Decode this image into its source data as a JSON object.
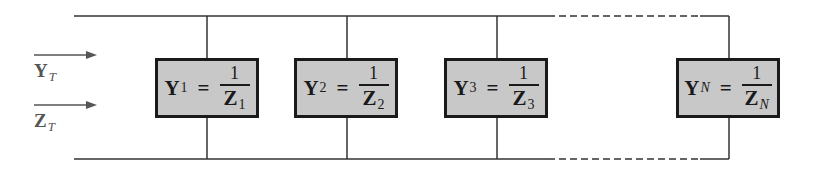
{
  "diagram": {
    "type": "parallel-admittance-network",
    "inputs": [
      {
        "symbol": "Y",
        "subscript": "T"
      },
      {
        "symbol": "Z",
        "subscript": "T"
      }
    ],
    "branches": [
      {
        "lhs": "Y",
        "lhs_sub": "1",
        "op": "=",
        "num": "1",
        "den": "Z",
        "den_sub": "1"
      },
      {
        "lhs": "Y",
        "lhs_sub": "2",
        "op": "=",
        "num": "1",
        "den": "Z",
        "den_sub": "2"
      },
      {
        "lhs": "Y",
        "lhs_sub": "3",
        "op": "=",
        "num": "1",
        "den": "Z",
        "den_sub": "3"
      },
      {
        "lhs": "Y",
        "lhs_sub": "N",
        "op": "=",
        "num": "1",
        "den": "Z",
        "den_sub": "N"
      }
    ],
    "colors": {
      "wire": "#333333",
      "box_fill": "#c8c8c8",
      "box_border": "#1a1a1a",
      "label": "#555555"
    }
  }
}
